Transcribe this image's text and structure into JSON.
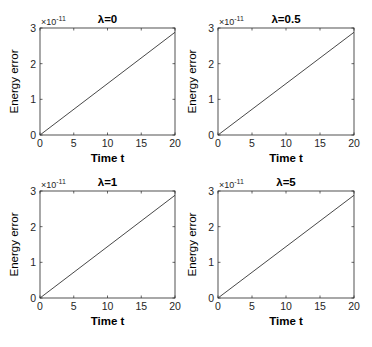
{
  "chart_data": [
    {
      "type": "line",
      "title": "λ=0",
      "xlabel": "Time t",
      "ylabel": "Energy error",
      "y_exponent_label": "×10",
      "y_exponent": "-11",
      "xlim": [
        0,
        20
      ],
      "ylim": [
        0,
        3
      ],
      "xticks": [
        0,
        5,
        10,
        15,
        20
      ],
      "yticks": [
        0,
        1,
        2,
        3
      ],
      "grid": false,
      "series": [
        {
          "name": "energy error",
          "x": [
            0,
            20
          ],
          "y": [
            0,
            2.88
          ]
        }
      ]
    },
    {
      "type": "line",
      "title": "λ=0.5",
      "xlabel": "Time t",
      "ylabel": "Energy error",
      "y_exponent_label": "×10",
      "y_exponent": "-11",
      "xlim": [
        0,
        20
      ],
      "ylim": [
        0,
        3
      ],
      "xticks": [
        0,
        5,
        10,
        15,
        20
      ],
      "yticks": [
        0,
        1,
        2,
        3
      ],
      "grid": false,
      "series": [
        {
          "name": "energy error",
          "x": [
            0,
            20
          ],
          "y": [
            0,
            2.88
          ]
        }
      ]
    },
    {
      "type": "line",
      "title": "λ=1",
      "xlabel": "Time t",
      "ylabel": "Energy error",
      "y_exponent_label": "×10",
      "y_exponent": "-11",
      "xlim": [
        0,
        20
      ],
      "ylim": [
        0,
        3
      ],
      "xticks": [
        0,
        5,
        10,
        15,
        20
      ],
      "yticks": [
        0,
        1,
        2,
        3
      ],
      "grid": false,
      "series": [
        {
          "name": "energy error",
          "x": [
            0,
            20
          ],
          "y": [
            0,
            2.88
          ]
        }
      ]
    },
    {
      "type": "line",
      "title": "λ=5",
      "xlabel": "Time t",
      "ylabel": "Energy error",
      "y_exponent_label": "×10",
      "y_exponent": "-11",
      "xlim": [
        0,
        20
      ],
      "ylim": [
        0,
        3
      ],
      "xticks": [
        0,
        5,
        10,
        15,
        20
      ],
      "yticks": [
        0,
        1,
        2,
        3
      ],
      "grid": false,
      "series": [
        {
          "name": "energy error",
          "x": [
            0,
            20
          ],
          "y": [
            0,
            2.88
          ]
        }
      ]
    }
  ]
}
